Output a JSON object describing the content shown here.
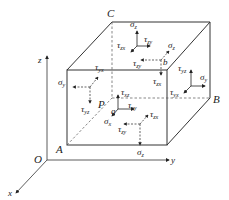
{
  "diagram": {
    "points": {
      "C": "C",
      "P": "P",
      "A": "A",
      "B": "B",
      "O": "O",
      "a": "a",
      "b": "b"
    },
    "axes": {
      "x": "x",
      "y": "y",
      "z": "z"
    },
    "stress_labels": {
      "sigma": "σ",
      "tau": "τ",
      "top_sigma_z": {
        "sym": "σ",
        "sub": "z"
      },
      "top_tau_zx": {
        "sym": "τ",
        "sub": "zx"
      },
      "top_tau_zy": {
        "sym": "τ",
        "sub": "zy"
      },
      "b_sigma_z": {
        "sym": "σ",
        "sub": "z"
      },
      "b_tau_zy": {
        "sym": "τ",
        "sub": "zy"
      },
      "b_tau_zx": {
        "sym": "τ",
        "sub": "zx"
      },
      "right_tau_yz": {
        "sym": "τ",
        "sub": "yz"
      },
      "right_sigma_y": {
        "sym": "σ",
        "sub": "y"
      },
      "right_tau_yx": {
        "sym": "τ",
        "sub": "yx"
      },
      "left_sigma_y": {
        "sym": "σ",
        "sub": "y"
      },
      "left_tau_yx": {
        "sym": "τ",
        "sub": "yx"
      },
      "left_tau_yz": {
        "sym": "τ",
        "sub": "yz"
      },
      "front_tau_xz": {
        "sym": "τ",
        "sub": "xz"
      },
      "front_tau_xy": {
        "sym": "τ",
        "sub": "xy"
      },
      "front_sigma_x": {
        "sym": "σ",
        "sub": "x"
      },
      "bottom_tau_zx": {
        "sym": "τ",
        "sub": "zx"
      },
      "bottom_tau_zy": {
        "sym": "τ",
        "sub": "zy"
      },
      "bottom_sigma_z": {
        "sym": "σ",
        "sub": "z"
      }
    },
    "colors": {
      "line": "#333333",
      "text": "#222222"
    }
  }
}
